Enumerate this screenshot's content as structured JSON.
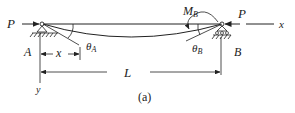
{
  "figure": {
    "caption": "(a)",
    "labels": {
      "load_left": "P",
      "load_right": "P",
      "axis_x": "x",
      "axis_y": "y",
      "support_left": "A",
      "support_right": "B",
      "distance": "x",
      "span": "L",
      "moment": "M",
      "moment_sub": "B",
      "theta": "θ",
      "theta_a_sub": "A",
      "theta_b_sub": "B"
    },
    "colors": {
      "ink": "#222222",
      "background": "#ffffff"
    }
  }
}
